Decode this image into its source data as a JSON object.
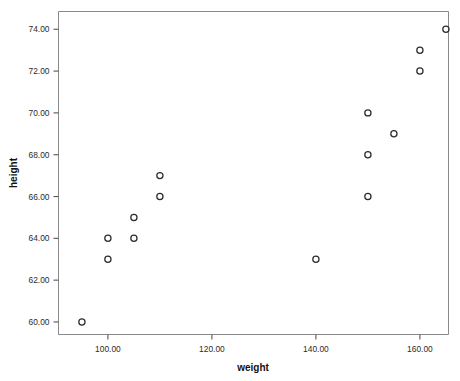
{
  "chart_data": {
    "type": "scatter",
    "title": "",
    "xlabel": "weight",
    "ylabel": "height",
    "xlim": [
      90.5,
      165.5
    ],
    "ylim": [
      59.4,
      74.85
    ],
    "xticks": [
      100,
      120,
      140,
      160
    ],
    "xtick_labels": [
      "100.00",
      "120.00",
      "140.00",
      "160.00"
    ],
    "yticks": [
      60,
      62,
      64,
      66,
      68,
      70,
      72,
      74
    ],
    "ytick_labels": [
      "60.00",
      "62.00",
      "64.00",
      "66.00",
      "68.00",
      "70.00",
      "72.00",
      "74.00"
    ],
    "grid": false,
    "legend": null,
    "marker": "open-circle",
    "marker_color": "#2d2d2d",
    "points": [
      {
        "x": 95,
        "y": 60
      },
      {
        "x": 100,
        "y": 63
      },
      {
        "x": 100,
        "y": 64
      },
      {
        "x": 105,
        "y": 64
      },
      {
        "x": 105,
        "y": 65
      },
      {
        "x": 110,
        "y": 66
      },
      {
        "x": 110,
        "y": 67
      },
      {
        "x": 140,
        "y": 63
      },
      {
        "x": 150,
        "y": 66
      },
      {
        "x": 150,
        "y": 68
      },
      {
        "x": 150,
        "y": 70
      },
      {
        "x": 155,
        "y": 69
      },
      {
        "x": 160,
        "y": 72
      },
      {
        "x": 160,
        "y": 73
      },
      {
        "x": 165,
        "y": 74
      }
    ]
  },
  "axes": {
    "x_title": "weight",
    "y_title": "height"
  }
}
